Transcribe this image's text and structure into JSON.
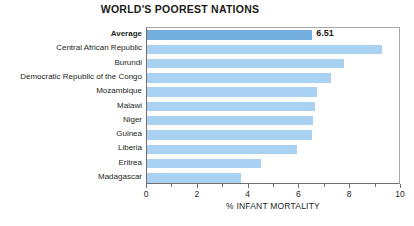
{
  "chart_data": {
    "type": "bar",
    "orientation": "horizontal",
    "title": "WORLD'S POOREST NATIONS",
    "xlabel": "% INFANT MORTALITY",
    "ylabel": "",
    "xlim": [
      0,
      10
    ],
    "xticks": [
      0,
      2,
      4,
      6,
      8,
      10
    ],
    "xtick_labels": [
      "0",
      "2",
      "4",
      "6",
      "8",
      "10"
    ],
    "xminor_ticks": [
      1,
      3,
      5,
      7,
      9
    ],
    "grid": false,
    "legend": false,
    "categories": [
      "Average",
      "Central African Republic",
      "Burundi",
      "Democratic Republic of the Congo",
      "Mozambique",
      "Malawi",
      "Niger",
      "Guinea",
      "Liberia",
      "Eritrea",
      "Madagascar"
    ],
    "values": [
      6.51,
      9.25,
      7.75,
      7.25,
      6.7,
      6.6,
      6.55,
      6.5,
      5.9,
      4.5,
      3.7
    ],
    "data_labels": [
      "6.51",
      "",
      "",
      "",
      "",
      "",
      "",
      "",
      "",
      "",
      ""
    ],
    "highlight_index": 0,
    "colors": {
      "bar": "#a9d2f2",
      "bar_highlight": "#74aede",
      "axis": "#6f6f6f",
      "frame": "#a8a8a8",
      "text": "#231f20"
    }
  }
}
